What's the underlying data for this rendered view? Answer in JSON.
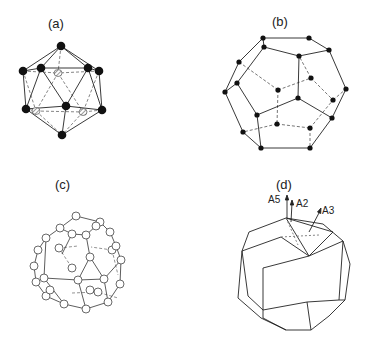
{
  "figure": {
    "panels": [
      {
        "id": "a",
        "label": "(a)",
        "shape": "icosahedron",
        "vertex_style": "filled-black-and-hatched"
      },
      {
        "id": "b",
        "label": "(b)",
        "shape": "pentagonal-dodecahedron",
        "vertex_style": "small-filled-black"
      },
      {
        "id": "c",
        "label": "(c)",
        "shape": "icosidodecahedral-cluster",
        "vertex_style": "open-circles"
      },
      {
        "id": "d",
        "label": "(d)",
        "shape": "rhombic-triacontahedron",
        "vertex_style": "none",
        "axes": [
          {
            "label": "A5"
          },
          {
            "label": "A2"
          },
          {
            "label": "A3"
          }
        ]
      }
    ]
  }
}
